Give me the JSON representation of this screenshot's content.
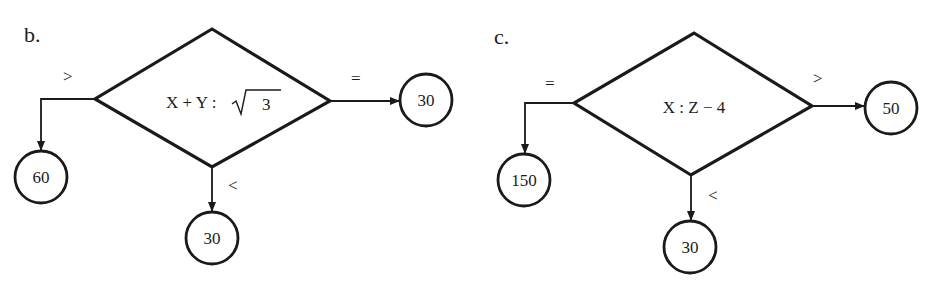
{
  "colors": {
    "background": "#ffffff",
    "ink": "#1a1a1a"
  },
  "panels": [
    {
      "label": "b.",
      "decision": {
        "condition_left": "X + Y :",
        "condition_radicand": "3",
        "condition_full": "X + Y : √3"
      },
      "branches": {
        "left": {
          "operator": ">",
          "target": "60"
        },
        "right": {
          "operator": "=",
          "target": "30"
        },
        "bottom": {
          "operator": "<",
          "target": "30"
        }
      }
    },
    {
      "label": "c.",
      "decision": {
        "condition_full": "X : Z − 4"
      },
      "branches": {
        "left": {
          "operator": "=",
          "target": "150"
        },
        "right": {
          "operator": ">",
          "target": "50"
        },
        "bottom": {
          "operator": "<",
          "target": "30"
        }
      }
    }
  ]
}
